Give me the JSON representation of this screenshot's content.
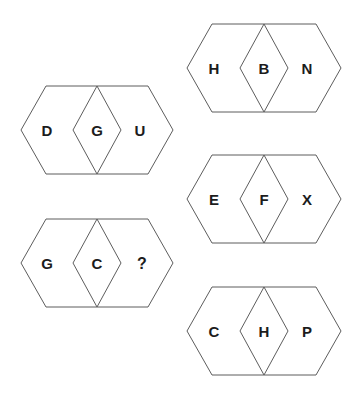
{
  "canvas": {
    "width": 362,
    "height": 394,
    "background_color": "#ffffff",
    "stroke_color": "#5d5d5d",
    "letter_color": "#1c1c1c"
  },
  "puzzle": {
    "type": "letter-analogy-hexagon-puzzle",
    "unknown_marker": "?",
    "figures": [
      {
        "id": "figure-dgu",
        "column": "left",
        "order": 1,
        "left_letter": "D",
        "center_letter": "G",
        "right_letter": "U",
        "hexagon": {
          "cx": 97,
          "cy": 130,
          "half_width": 76,
          "half_height": 44,
          "flat_half_width": 51
        },
        "rhombus": {
          "cx": 97,
          "cy": 130,
          "half_width": 24,
          "half_height": 44
        },
        "letter_positions": {
          "left_x": 47,
          "center_x": 97,
          "right_x": 140,
          "y": 130
        }
      },
      {
        "id": "figure-gc-unknown",
        "column": "left",
        "order": 2,
        "left_letter": "G",
        "center_letter": "C",
        "right_letter": "?",
        "hexagon": {
          "cx": 97,
          "cy": 263,
          "half_width": 76,
          "half_height": 44,
          "flat_half_width": 51
        },
        "rhombus": {
          "cx": 97,
          "cy": 263,
          "half_width": 24,
          "half_height": 44
        },
        "letter_positions": {
          "left_x": 47,
          "center_x": 97,
          "right_x": 142,
          "y": 263
        }
      },
      {
        "id": "figure-hbn",
        "column": "right",
        "order": 1,
        "left_letter": "H",
        "center_letter": "B",
        "right_letter": "N",
        "hexagon": {
          "cx": 264,
          "cy": 68,
          "half_width": 77,
          "half_height": 44,
          "flat_half_width": 52
        },
        "rhombus": {
          "cx": 264,
          "cy": 68,
          "half_width": 24,
          "half_height": 44
        },
        "letter_positions": {
          "left_x": 214,
          "center_x": 264,
          "right_x": 307,
          "y": 68
        }
      },
      {
        "id": "figure-efx",
        "column": "right",
        "order": 2,
        "left_letter": "E",
        "center_letter": "F",
        "right_letter": "X",
        "hexagon": {
          "cx": 264,
          "cy": 199,
          "half_width": 77,
          "half_height": 44,
          "flat_half_width": 52
        },
        "rhombus": {
          "cx": 264,
          "cy": 199,
          "half_width": 24,
          "half_height": 44
        },
        "letter_positions": {
          "left_x": 214,
          "center_x": 264,
          "right_x": 307,
          "y": 199
        }
      },
      {
        "id": "figure-chp",
        "column": "right",
        "order": 3,
        "left_letter": "C",
        "center_letter": "H",
        "right_letter": "P",
        "hexagon": {
          "cx": 264,
          "cy": 331,
          "half_width": 77,
          "half_height": 44,
          "flat_half_width": 52
        },
        "rhombus": {
          "cx": 264,
          "cy": 331,
          "half_width": 24,
          "half_height": 44
        },
        "letter_positions": {
          "left_x": 214,
          "center_x": 264,
          "right_x": 307,
          "y": 331
        }
      }
    ]
  }
}
